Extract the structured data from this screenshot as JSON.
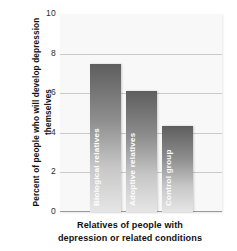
{
  "chart_data": {
    "type": "bar",
    "title": "",
    "subtitle": "",
    "categories": [
      "Biological relatives",
      "Adoptive relatives",
      "Control group"
    ],
    "values": [
      7.5,
      6.1,
      4.35
    ],
    "xlabel": "Relatives of people with depression or related conditions",
    "xlabel_lines": [
      "Relatives of people with",
      "depression or related conditions"
    ],
    "ylabel": "Percent of people who will develop depression themselves",
    "ylim": [
      0,
      10
    ],
    "yticks": [
      "0",
      "2",
      "4",
      "6",
      "8",
      "10"
    ],
    "ytick_values": [
      0,
      2,
      4,
      6,
      8,
      10
    ],
    "grid": true,
    "legend": "none",
    "bar_label_colors": [
      "#ffffff",
      "#ffffff",
      "#ffffff"
    ],
    "colors": {
      "bar_top": "#5e5e5e",
      "bar_bottom": "#e6e6e6",
      "plot_background": "#f8f8f8",
      "page_background": "#ffffff",
      "gridline": "#c9c9c9",
      "axis": "#9a9a9a",
      "text": "#111111"
    }
  },
  "axis": {
    "y": {
      "title": "Percent of people who will develop depression themselves",
      "ticks": [
        "10",
        "8",
        "6",
        "4",
        "2",
        "0"
      ]
    },
    "x": {
      "title_line1": "Relatives of people with",
      "title_line2": "depression or related conditions"
    }
  },
  "bars": [
    {
      "label": "Biological relatives",
      "value": 7.5
    },
    {
      "label": "Adoptive relatives",
      "value": 6.1
    },
    {
      "label": "Control group",
      "value": 4.35
    }
  ]
}
